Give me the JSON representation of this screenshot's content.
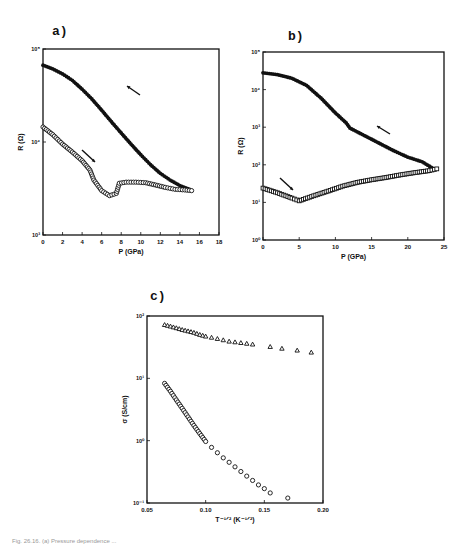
{
  "figure": {
    "caption_fragment": "Fig. 26.16. (a) Pressure dependence ..."
  },
  "chart_data": [
    {
      "id": "a",
      "panel_label": "a)",
      "type": "scatter",
      "title": "",
      "xlabel": "P (GPa)",
      "ylabel": "R (Ω)",
      "xlim": [
        0,
        18
      ],
      "ylim": [
        1000,
        100000
      ],
      "yscale": "log",
      "xticks": [
        0,
        2,
        4,
        6,
        8,
        10,
        12,
        14,
        16,
        18
      ],
      "yticks": [
        {
          "value": 1000,
          "label": "10³"
        },
        {
          "value": 10000,
          "label": "10⁴"
        },
        {
          "value": 100000,
          "label": "10⁵"
        }
      ],
      "grid": false,
      "annotations": [
        "arrow pointing up-left on closed-circle curve (decompression)",
        "arrow pointing down-right on open-circle curve (compression)"
      ],
      "series": [
        {
          "name": "decompression (filled circles)",
          "marker": "filled-circle",
          "x": [
            0,
            1,
            2,
            3,
            4,
            5,
            6,
            7,
            8,
            9,
            10,
            11,
            12,
            13,
            14,
            15
          ],
          "y": [
            67000,
            61000,
            54000,
            46000,
            37000,
            29000,
            22000,
            16500,
            12500,
            9500,
            7300,
            5700,
            4600,
            3900,
            3400,
            3100
          ]
        },
        {
          "name": "compression (open circles)",
          "marker": "open-circle",
          "x": [
            0,
            1,
            2,
            3,
            4,
            4.8,
            5.2,
            6,
            6.8,
            7.5,
            7.8,
            8.5,
            9.5,
            10.5,
            11.5,
            12.5,
            13.5,
            14.5,
            15.2
          ],
          "y": [
            14500,
            12000,
            9500,
            7800,
            6300,
            5000,
            3900,
            3000,
            2650,
            2800,
            3600,
            3700,
            3700,
            3650,
            3450,
            3250,
            3100,
            3050,
            3000
          ]
        }
      ]
    },
    {
      "id": "b",
      "panel_label": "b)",
      "type": "scatter",
      "title": "",
      "xlabel": "P (GPa)",
      "ylabel": "R (Ω)",
      "xlim": [
        0,
        25
      ],
      "ylim": [
        1,
        100000
      ],
      "yscale": "log",
      "xticks": [
        0,
        5,
        10,
        15,
        20,
        25
      ],
      "yticks": [
        {
          "value": 1,
          "label": "10⁰"
        },
        {
          "value": 10,
          "label": "10¹"
        },
        {
          "value": 100,
          "label": "10²"
        },
        {
          "value": 1000,
          "label": "10³"
        },
        {
          "value": 10000,
          "label": "10⁴"
        },
        {
          "value": 100000,
          "label": "10⁵"
        }
      ],
      "grid": false,
      "annotations": [
        "arrow pointing up-left on upper curve",
        "arrow pointing down-right on lower curve"
      ],
      "series": [
        {
          "name": "upper branch (filled)",
          "marker": "filled-circle",
          "x": [
            0,
            2,
            4,
            6,
            8,
            10,
            11.5,
            12,
            14,
            16,
            18,
            20,
            22,
            23.5
          ],
          "y": [
            28000,
            25000,
            20000,
            13000,
            6000,
            2400,
            1300,
            950,
            600,
            380,
            240,
            160,
            120,
            80
          ]
        },
        {
          "name": "lower branch (open)",
          "marker": "open-square",
          "x": [
            0,
            2,
            4,
            5,
            7,
            9,
            11,
            13,
            15,
            17,
            19,
            21,
            23,
            24
          ],
          "y": [
            24,
            18,
            13,
            11,
            15,
            20,
            27,
            34,
            40,
            46,
            54,
            62,
            70,
            78
          ]
        }
      ]
    },
    {
      "id": "c",
      "panel_label": "c)",
      "type": "scatter",
      "title": "",
      "xlabel": "T^-1/2 (K^-1/2)",
      "ylabel": "σ (S/cm)",
      "xlim": [
        0.05,
        0.2
      ],
      "ylim": [
        0.1,
        100
      ],
      "yscale": "log",
      "xticks": [
        0.05,
        0.1,
        0.15,
        0.2
      ],
      "yticks": [
        {
          "value": 0.1,
          "label": "10⁻¹"
        },
        {
          "value": 1,
          "label": "10⁰"
        },
        {
          "value": 10,
          "label": "10¹"
        },
        {
          "value": 100,
          "label": "10²"
        }
      ],
      "grid": false,
      "series": [
        {
          "name": "triangles",
          "marker": "open-triangle",
          "x": [
            0.065,
            0.07,
            0.075,
            0.08,
            0.085,
            0.09,
            0.095,
            0.1,
            0.105,
            0.11,
            0.115,
            0.12,
            0.125,
            0.13,
            0.135,
            0.14,
            0.155,
            0.165,
            0.178,
            0.19
          ],
          "y": [
            72,
            68,
            64,
            60,
            57,
            54,
            50,
            47,
            45,
            43,
            41,
            39,
            38,
            37,
            36,
            35,
            32,
            30,
            28,
            26
          ]
        },
        {
          "name": "circles",
          "marker": "open-circle",
          "x": [
            0.065,
            0.07,
            0.075,
            0.08,
            0.085,
            0.09,
            0.095,
            0.1,
            0.105,
            0.11,
            0.115,
            0.12,
            0.125,
            0.13,
            0.135,
            0.14,
            0.145,
            0.15,
            0.155,
            0.17
          ],
          "y": [
            8.3,
            6.2,
            4.5,
            3.3,
            2.4,
            1.75,
            1.3,
            0.97,
            0.78,
            0.64,
            0.53,
            0.45,
            0.38,
            0.32,
            0.27,
            0.23,
            0.195,
            0.17,
            0.145,
            0.12
          ]
        }
      ]
    }
  ]
}
